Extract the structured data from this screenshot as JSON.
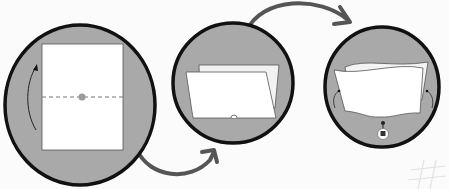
{
  "figure": {
    "type": "instructional-diagram",
    "clipped_header_text": "",
    "colors": {
      "background": "#fbfbfb",
      "circle_fill": "#a9a9a9",
      "circle_stroke": "#111111",
      "paper": "#ffffff",
      "arrow": "#555555",
      "fold_line": "#777777",
      "fold_dot": "#9a9a9a"
    },
    "steps": [
      {
        "index": 1,
        "description": "Flat sheet with horizontal dashed fold line and center dot; curved arrow indicates folding bottom up"
      },
      {
        "index": 2,
        "description": "Sheet folded in half, small notch at bottom center"
      },
      {
        "index": 3,
        "description": "Folded edges curled with small curved arrows on both sides; small marker and tag below the notch"
      }
    ],
    "connectors": [
      {
        "from": 1,
        "to": 2,
        "direction": "curved arrow below"
      },
      {
        "from": 2,
        "to": 3,
        "direction": "curved arrow above"
      }
    ]
  }
}
